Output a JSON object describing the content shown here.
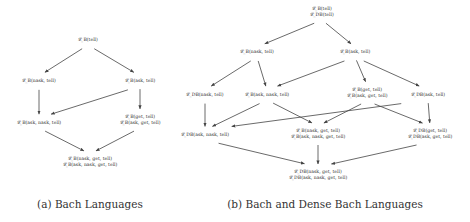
{
  "panel_a": {
    "caption": "(a) Bach Languages",
    "nodes": [
      {
        "id": "a1",
        "lines": [
          "𝓛_B(tell)"
        ],
        "x": 88,
        "y": 40
      },
      {
        "id": "a2",
        "lines": [
          "𝓛_B(nask, tell)"
        ],
        "x": 39,
        "y": 81
      },
      {
        "id": "a3",
        "lines": [
          "𝓛_B(ask, tell)"
        ],
        "x": 140,
        "y": 81
      },
      {
        "id": "a4",
        "lines": [
          "𝓛_B(ask, nask, tell)"
        ],
        "x": 39,
        "y": 123
      },
      {
        "id": "a5",
        "lines": [
          "𝓛_B(get, tell)",
          "𝓛_B(ask, get, tell)"
        ],
        "x": 140,
        "y": 120
      },
      {
        "id": "a6",
        "lines": [
          "𝓛_B(nask, get, tell)",
          "𝓛_B(ask, nask, get, tell)"
        ],
        "x": 90,
        "y": 162
      }
    ],
    "edges": [
      [
        "a1",
        "a2"
      ],
      [
        "a1",
        "a3"
      ],
      [
        "a2",
        "a4"
      ],
      [
        "a3",
        "a4"
      ],
      [
        "a3",
        "a5"
      ],
      [
        "a4",
        "a6"
      ],
      [
        "a5",
        "a6"
      ]
    ]
  },
  "panel_b": {
    "caption": "(b) Bach and Dense Bach Languages",
    "nodes": [
      {
        "id": "b1",
        "lines": [
          "𝓛_B(tell)",
          "𝓛_DB(tell)"
        ],
        "x": 322,
        "y": 12
      },
      {
        "id": "b2",
        "lines": [
          "𝓛_B(nask, tell)"
        ],
        "x": 257,
        "y": 52
      },
      {
        "id": "b3",
        "lines": [
          "𝓛_B(ask, tell)"
        ],
        "x": 355,
        "y": 52
      },
      {
        "id": "b4",
        "lines": [
          "𝓛_DB(nask, tell)"
        ],
        "x": 205,
        "y": 95
      },
      {
        "id": "b5",
        "lines": [
          "𝓛_B(ask, nask, tell)"
        ],
        "x": 267,
        "y": 95
      },
      {
        "id": "b6",
        "lines": [
          "𝓛_B(get, tell)",
          "𝓛_B(ask, get, tell)"
        ],
        "x": 367,
        "y": 93
      },
      {
        "id": "b7",
        "lines": [
          "𝓛_DB(ask, tell)"
        ],
        "x": 428,
        "y": 95
      },
      {
        "id": "b8",
        "lines": [
          "𝓛_DB(ask, nask, tell)"
        ],
        "x": 205,
        "y": 135
      },
      {
        "id": "b9",
        "lines": [
          "𝓛_B(nask, get, tell)",
          "𝓛_B(ask, nask, get, tell)"
        ],
        "x": 318,
        "y": 134
      },
      {
        "id": "b10",
        "lines": [
          "𝓛_DB(get, tell)",
          "𝓛_DB(ask, get, tell)"
        ],
        "x": 430,
        "y": 134
      },
      {
        "id": "b11",
        "lines": [
          "𝓛_DB(nask, get, tell)",
          "𝓛_DB(ask, nask, get, tell)"
        ],
        "x": 318,
        "y": 175
      }
    ],
    "edges": [
      [
        "b1",
        "b2"
      ],
      [
        "b1",
        "b3"
      ],
      [
        "b2",
        "b4"
      ],
      [
        "b2",
        "b5"
      ],
      [
        "b3",
        "b5"
      ],
      [
        "b3",
        "b6"
      ],
      [
        "b3",
        "b7"
      ],
      [
        "b4",
        "b8"
      ],
      [
        "b5",
        "b8"
      ],
      [
        "b5",
        "b9"
      ],
      [
        "b6",
        "b9"
      ],
      [
        "b6",
        "b10"
      ],
      [
        "b7",
        "b8"
      ],
      [
        "b7",
        "b10"
      ],
      [
        "b8",
        "b11"
      ],
      [
        "b9",
        "b11"
      ],
      [
        "b10",
        "b11"
      ]
    ]
  },
  "style": {
    "edge_color": "#444444",
    "text_color": "#333333"
  }
}
